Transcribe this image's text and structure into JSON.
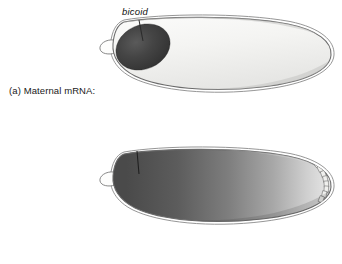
{
  "figure": {
    "background_color": "#ffffff",
    "width": 342,
    "height": 264
  },
  "panels": [
    {
      "id": "a",
      "label": "(a) Maternal mRNA:",
      "gene_label": "bicoid",
      "description": "Drosophila embryo with bicoid mRNA localized as a dark ellipse at the anterior pole; remainder of embryo is pale/unstained.",
      "embryo_fill": "#f2f2f0",
      "localization_fill_dark": "#3a3a3a",
      "localization_fill_light": "#555555",
      "outline_color": "#6b6b6b",
      "pattern": "anterior-localized-spot"
    },
    {
      "id": "b",
      "label": "(b) Protein:",
      "gene_label": "bicoid",
      "description": "Drosophila embryo with bicoid protein forming a smooth anterior-to-posterior concentration gradient, dark at anterior fading to light at posterior; nuclei/cells visible at posterior edge.",
      "gradient_stops": [
        {
          "offset": "0%",
          "color": "#4a4a4a"
        },
        {
          "offset": "25%",
          "color": "#5c5c5c"
        },
        {
          "offset": "50%",
          "color": "#7e7e7e"
        },
        {
          "offset": "72%",
          "color": "#a8a8a8"
        },
        {
          "offset": "88%",
          "color": "#cfcfcf"
        },
        {
          "offset": "100%",
          "color": "#e8e8e8"
        }
      ],
      "outline_color": "#6b6b6b",
      "pattern": "anterior-posterior-gradient"
    }
  ],
  "colors": {
    "text": "#1a1a1a",
    "outline": "#6b6b6b",
    "leader_line": "#2b2b2b",
    "background": "#ffffff"
  }
}
